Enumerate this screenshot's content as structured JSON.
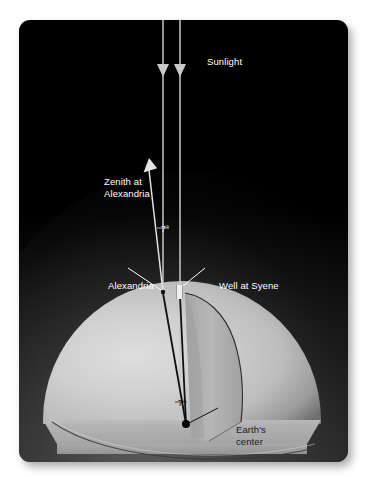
{
  "figure": {
    "background_color": "#ffffff",
    "panel_color": "#000000",
    "earth_color": "#c9c9c9",
    "cut_face_color": "#b0b0b0",
    "ray_color": "#d8d8d8",
    "label_color": "#ffffff"
  },
  "labels": {
    "sunlight": "Sunlight",
    "zenith": "Zenith at\nAlexandria",
    "alexandria": "Alexandria",
    "syene": "Well at Syene",
    "earth_center": "Earth's\ncenter",
    "angle_top": "7°",
    "angle_bottom": "7°"
  },
  "diagram_data": {
    "type": "diagram",
    "subject": "Eratosthenes' method for measuring the circumference of the Earth",
    "angle_value": 7,
    "angle_unit": "degrees",
    "elements": [
      {
        "name": "sunlight-ray-left",
        "kind": "arrow",
        "direction": "downward",
        "x": 163
      },
      {
        "name": "sunlight-ray-right",
        "kind": "arrow",
        "direction": "downward",
        "x": 180
      },
      {
        "name": "zenith-arrow",
        "kind": "arrow",
        "direction": "up-left",
        "from": "Alexandria"
      },
      {
        "name": "alexandria-point",
        "kind": "surface-point"
      },
      {
        "name": "well-at-syene",
        "kind": "vertical-well"
      },
      {
        "name": "earth-center-point",
        "kind": "point"
      },
      {
        "name": "earth-hemisphere",
        "kind": "cutaway-sphere"
      }
    ],
    "angles": [
      {
        "label": "7°",
        "location": "between zenith at Alexandria and sunlight ray",
        "value": 7
      },
      {
        "label": "7°",
        "location": "at Earth's center between Alexandria and Syene radii",
        "value": 7
      }
    ]
  }
}
